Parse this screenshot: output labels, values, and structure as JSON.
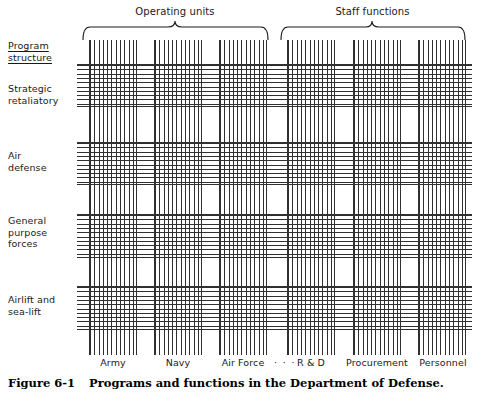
{
  "figure": {
    "caption_number": "Figure 6-1",
    "caption_text": "Programs and functions in the Department of Defense."
  },
  "groups": [
    {
      "name": "operating-units",
      "label": "Operating units",
      "x": 82,
      "width": 186
    },
    {
      "name": "staff-functions",
      "label": "Staff functions",
      "x": 280,
      "width": 185
    }
  ],
  "axis": {
    "row_axis_label": "Program\nstructure",
    "row_axis_underlined": true
  },
  "rows": [
    {
      "name": "strategic-retaliatory",
      "label": "Strategic\nretaliatory",
      "label_top": 83,
      "band_top": 64,
      "band_height": 43
    },
    {
      "name": "air-defense",
      "label": "Air\ndefense",
      "label_top": 150,
      "band_top": 142,
      "band_height": 43
    },
    {
      "name": "general-purpose-forces",
      "label": "General\npurpose\nforces",
      "label_top": 215,
      "band_top": 214,
      "band_height": 44
    },
    {
      "name": "airlift-and-sea-lift",
      "label": "Airlift and\nsea-lift",
      "label_top": 294,
      "band_top": 286,
      "band_height": 44
    }
  ],
  "columns": [
    {
      "name": "army",
      "label": "Army",
      "x": 89,
      "width": 48
    },
    {
      "name": "navy",
      "label": "Navy",
      "x": 154,
      "width": 48
    },
    {
      "name": "air-force",
      "label": "Air Force",
      "x": 219,
      "width": 48
    },
    {
      "name": "r-and-d",
      "label": "R & D",
      "x": 287,
      "width": 48
    },
    {
      "name": "procurement",
      "label": "Procurement",
      "x": 353,
      "width": 48
    },
    {
      "name": "personnel",
      "label": "Personnel",
      "x": 418,
      "width": 48
    }
  ],
  "ellipsis": {
    "label": "· · ·",
    "x": 270,
    "width": 28
  },
  "matrix": {
    "vertical_band_top": 40,
    "vertical_band_bottom": 355,
    "horizontal_band_left": 77,
    "horizontal_band_right": 472,
    "line_color": "#303030"
  }
}
